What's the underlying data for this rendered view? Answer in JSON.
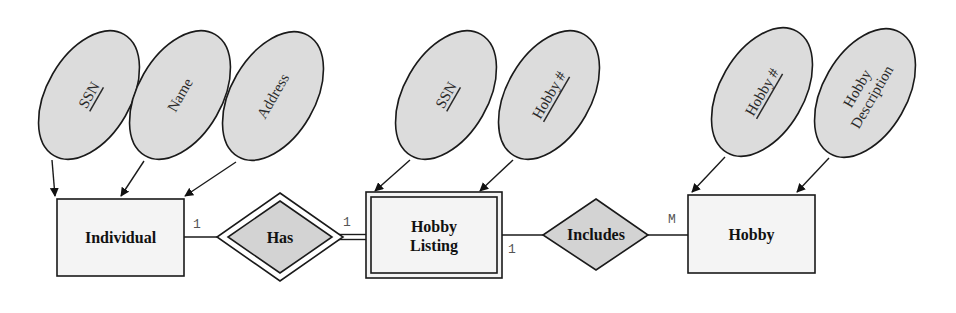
{
  "diagram": {
    "type": "er-diagram",
    "entities": [
      {
        "id": "individual",
        "label": "Individual",
        "weak": false
      },
      {
        "id": "hobby_listing",
        "label_lines": [
          "Hobby",
          "Listing"
        ],
        "weak": true
      },
      {
        "id": "hobby",
        "label": "Hobby",
        "weak": false
      }
    ],
    "relationships": [
      {
        "id": "has",
        "label": "Has",
        "identifying": true
      },
      {
        "id": "includes",
        "label": "Includes",
        "identifying": false
      }
    ],
    "attributes": {
      "individual": [
        {
          "label": "SSN",
          "key": true
        },
        {
          "label": "Name",
          "key": false
        },
        {
          "label": "Address",
          "key": false
        }
      ],
      "hobby_listing": [
        {
          "label": "SSN",
          "key": true
        },
        {
          "label": "Hobby #",
          "key": true
        }
      ],
      "hobby": [
        {
          "label": "Hobby #",
          "key": true
        },
        {
          "label_lines": [
            "Hobby",
            "Description"
          ],
          "key": false
        }
      ]
    },
    "cardinalities": {
      "individual_has": "1",
      "has_hobby_listing": "1",
      "hobby_listing_includes": "1",
      "includes_hobby": "M"
    },
    "colors": {
      "attribute_fill": "#dcdcdc",
      "entity_fill": "#f4f4f4",
      "relationship_fill": "#d3d3d3",
      "stroke": "#1a1a1a"
    }
  }
}
